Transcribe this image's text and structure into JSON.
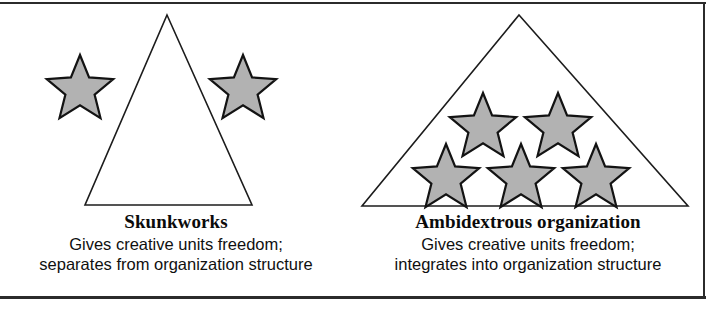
{
  "figure": {
    "width": 728,
    "height": 310,
    "background_color": "#ffffff",
    "border_color": "#2b2b2b",
    "star_fill_color": "#b2b2b2",
    "star_outline_color": "#131313",
    "triangle_fill_color": "#ffffff",
    "triangle_outline_color": "#1c1c1c"
  },
  "panels": [
    {
      "id": "skunkworks",
      "title": "Skunkworks",
      "description_line1": "Gives creative units freedom;",
      "description_line2": "separates from organization structure",
      "star_count_inside": 0,
      "star_count_outside": 2,
      "triangle": {
        "apex_x": 167,
        "apex_y": 14,
        "base_left_x": 85,
        "base_right_x": 252,
        "base_y": 204
      },
      "stars": [
        {
          "cx": 80,
          "cy": 82,
          "r": 31,
          "position": "outside-left"
        },
        {
          "cx": 243,
          "cy": 82,
          "r": 31,
          "position": "outside-right"
        }
      ]
    },
    {
      "id": "ambidextrous",
      "title": "Ambidextrous organization",
      "description_line1": "Gives creative units freedom;",
      "description_line2": "integrates into organization structure",
      "star_count_inside": 5,
      "star_count_outside": 0,
      "triangle": {
        "apex_x": 519,
        "apex_y": 14,
        "base_left_x": 362,
        "base_right_x": 688,
        "base_y": 205
      },
      "stars": [
        {
          "cx": 483,
          "cy": 123,
          "r": 31,
          "position": "inside-top-left"
        },
        {
          "cx": 558,
          "cy": 123,
          "r": 31,
          "position": "inside-top-right"
        },
        {
          "cx": 446,
          "cy": 174,
          "r": 31,
          "position": "inside-bottom-left"
        },
        {
          "cx": 521,
          "cy": 174,
          "r": 31,
          "position": "inside-bottom-center"
        },
        {
          "cx": 596,
          "cy": 174,
          "r": 31,
          "position": "inside-bottom-right"
        }
      ]
    }
  ]
}
